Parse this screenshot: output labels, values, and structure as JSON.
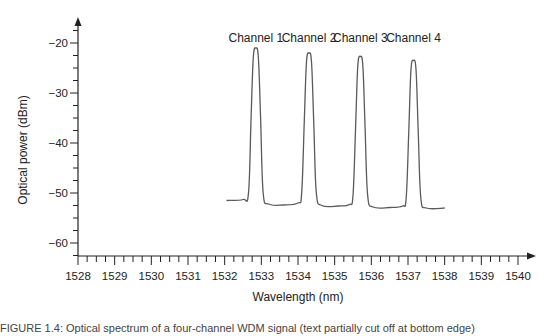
{
  "chart_data": {
    "type": "line",
    "title": "",
    "xlabel": "Wavelength (nm)",
    "ylabel": "Optical power (dBm)",
    "xlim": [
      1528,
      1540
    ],
    "ylim": [
      -63,
      -16
    ],
    "x_ticks": [
      1528,
      1529,
      1530,
      1531,
      1532,
      1533,
      1534,
      1535,
      1536,
      1537,
      1538,
      1539,
      1540
    ],
    "y_ticks": [
      -20,
      -30,
      -40,
      -50,
      -60
    ],
    "x_minor_per_major": 3,
    "y_minor_step": 2.5,
    "grid": false,
    "legend": null,
    "annotations": [
      {
        "text": "Channel 1",
        "x": 1532.85
      },
      {
        "text": "Channel 2",
        "x": 1534.3
      },
      {
        "text": "Channel 3",
        "x": 1535.7
      },
      {
        "text": "Channel 4",
        "x": 1537.15
      }
    ],
    "series": [
      {
        "name": "Spectrum",
        "peaks": [
          {
            "channel": "Channel 1",
            "wavelength": 1532.85,
            "power": -21.0
          },
          {
            "channel": "Channel 2",
            "wavelength": 1534.3,
            "power": -22.0
          },
          {
            "channel": "Channel 3",
            "wavelength": 1535.7,
            "power": -22.7
          },
          {
            "channel": "Channel 4",
            "wavelength": 1537.15,
            "power": -23.5
          }
        ],
        "x": [
          1532.05,
          1532.5,
          1532.65,
          1532.72,
          1532.78,
          1532.85,
          1532.92,
          1532.98,
          1533.05,
          1533.2,
          1533.6,
          1534.0,
          1534.1,
          1534.17,
          1534.23,
          1534.3,
          1534.37,
          1534.43,
          1534.5,
          1534.65,
          1535.1,
          1535.4,
          1535.5,
          1535.57,
          1535.63,
          1535.7,
          1535.77,
          1535.83,
          1535.9,
          1536.05,
          1536.5,
          1536.85,
          1536.95,
          1537.02,
          1537.08,
          1537.15,
          1537.22,
          1537.28,
          1537.35,
          1537.5,
          1538.0
        ],
        "y": [
          -51.5,
          -51.3,
          -50.0,
          -35.0,
          -23.0,
          -21.0,
          -23.0,
          -35.0,
          -50.0,
          -52.2,
          -52.4,
          -52.0,
          -50.0,
          -36.0,
          -24.0,
          -22.0,
          -24.0,
          -36.0,
          -50.0,
          -52.5,
          -52.6,
          -52.3,
          -50.5,
          -37.0,
          -24.7,
          -22.7,
          -24.7,
          -37.0,
          -50.5,
          -52.8,
          -52.9,
          -52.6,
          -51.0,
          -38.0,
          -25.5,
          -23.5,
          -25.5,
          -38.0,
          -51.0,
          -53.0,
          -53.0
        ]
      }
    ]
  },
  "caption": "FIGURE 1.4: Optical spectrum of a four-channel WDM signal (text partially cut off at bottom edge)",
  "colors": {
    "trace": "#5a5a5a",
    "axis": "#222222",
    "text": "#222222",
    "background": "#ffffff"
  }
}
